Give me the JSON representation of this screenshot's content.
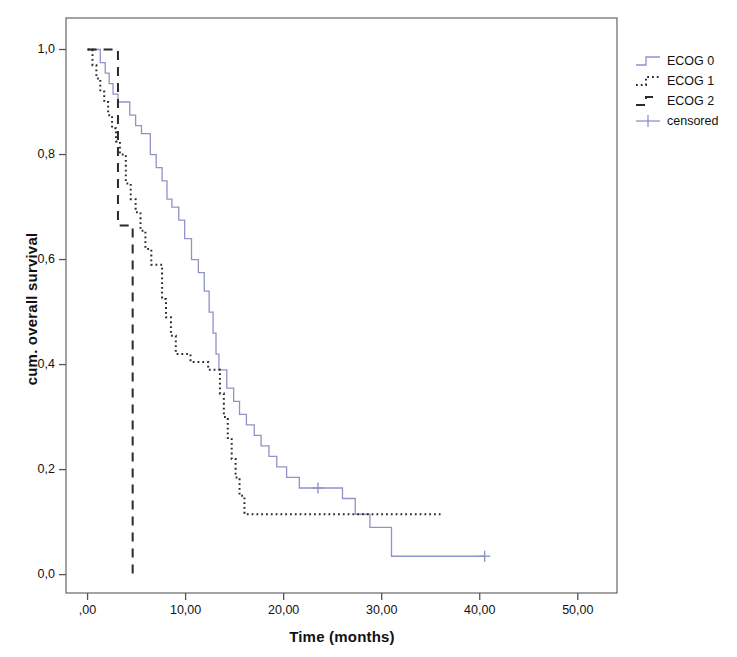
{
  "chart_data": {
    "type": "line",
    "plot_kind": "kaplan-meier-survival",
    "title": "",
    "xlabel": "Time (months)",
    "ylabel": "cum. overall survival",
    "xlim": [
      -2.2,
      54.0
    ],
    "ylim": [
      -0.035,
      1.06
    ],
    "xticks": [
      0,
      10,
      20,
      30,
      40,
      50
    ],
    "xtick_labels": [
      ",00",
      "10,00",
      "20,00",
      "30,00",
      "40,00",
      "50,00"
    ],
    "yticks": [
      0.0,
      0.2,
      0.4,
      0.6,
      0.8,
      1.0
    ],
    "ytick_labels": [
      "0,0",
      "0,2",
      "0,4",
      "0,6",
      "0,8",
      "1,0"
    ],
    "grid": false,
    "legend_position": "outside-right-top",
    "decimal_separator": "comma",
    "colors": {
      "ecog0": "#8f93c8",
      "ecog1": "#2b2b2b",
      "ecog2": "#2b2b2b",
      "censored": "#8f93c8",
      "axis": "#555555",
      "frame": "#666666"
    },
    "series": [
      {
        "name": "ECOG 0",
        "style": "solid",
        "color": "#8f93c8",
        "points": [
          [
            0.0,
            1.0
          ],
          [
            1.3,
            1.0
          ],
          [
            1.3,
            0.975
          ],
          [
            1.8,
            0.975
          ],
          [
            1.8,
            0.955
          ],
          [
            2.2,
            0.955
          ],
          [
            2.2,
            0.935
          ],
          [
            2.6,
            0.935
          ],
          [
            2.6,
            0.915
          ],
          [
            3.1,
            0.915
          ],
          [
            3.1,
            0.9
          ],
          [
            4.3,
            0.9
          ],
          [
            4.3,
            0.875
          ],
          [
            4.9,
            0.875
          ],
          [
            4.9,
            0.855
          ],
          [
            5.5,
            0.855
          ],
          [
            5.5,
            0.84
          ],
          [
            6.4,
            0.84
          ],
          [
            6.4,
            0.8
          ],
          [
            7.0,
            0.8
          ],
          [
            7.0,
            0.775
          ],
          [
            7.6,
            0.775
          ],
          [
            7.6,
            0.75
          ],
          [
            8.1,
            0.75
          ],
          [
            8.1,
            0.715
          ],
          [
            8.6,
            0.715
          ],
          [
            8.6,
            0.7
          ],
          [
            9.3,
            0.7
          ],
          [
            9.3,
            0.675
          ],
          [
            9.9,
            0.675
          ],
          [
            9.9,
            0.64
          ],
          [
            10.6,
            0.64
          ],
          [
            10.6,
            0.6
          ],
          [
            11.3,
            0.6
          ],
          [
            11.3,
            0.575
          ],
          [
            11.9,
            0.575
          ],
          [
            11.9,
            0.54
          ],
          [
            12.4,
            0.54
          ],
          [
            12.4,
            0.5
          ],
          [
            12.8,
            0.5
          ],
          [
            12.8,
            0.46
          ],
          [
            13.1,
            0.46
          ],
          [
            13.1,
            0.42
          ],
          [
            13.4,
            0.42
          ],
          [
            13.4,
            0.39
          ],
          [
            14.2,
            0.39
          ],
          [
            14.2,
            0.355
          ],
          [
            14.9,
            0.355
          ],
          [
            14.9,
            0.33
          ],
          [
            15.5,
            0.33
          ],
          [
            15.5,
            0.305
          ],
          [
            16.2,
            0.305
          ],
          [
            16.2,
            0.285
          ],
          [
            17.0,
            0.285
          ],
          [
            17.0,
            0.265
          ],
          [
            17.7,
            0.265
          ],
          [
            17.7,
            0.245
          ],
          [
            18.5,
            0.245
          ],
          [
            18.5,
            0.225
          ],
          [
            19.3,
            0.225
          ],
          [
            19.3,
            0.205
          ],
          [
            20.3,
            0.205
          ],
          [
            20.3,
            0.185
          ],
          [
            21.6,
            0.185
          ],
          [
            21.6,
            0.165
          ],
          [
            26.0,
            0.165
          ],
          [
            26.0,
            0.145
          ],
          [
            27.3,
            0.145
          ],
          [
            27.3,
            0.115
          ],
          [
            28.8,
            0.115
          ],
          [
            28.8,
            0.09
          ],
          [
            31.0,
            0.09
          ],
          [
            31.0,
            0.035
          ],
          [
            40.5,
            0.035
          ]
        ],
        "censored_points": [
          [
            23.5,
            0.165
          ],
          [
            40.5,
            0.035
          ]
        ]
      },
      {
        "name": "ECOG 1",
        "style": "dotted",
        "color": "#2b2b2b",
        "points": [
          [
            0.0,
            1.0
          ],
          [
            0.5,
            1.0
          ],
          [
            0.5,
            0.97
          ],
          [
            0.9,
            0.97
          ],
          [
            0.9,
            0.945
          ],
          [
            1.3,
            0.945
          ],
          [
            1.3,
            0.92
          ],
          [
            1.7,
            0.92
          ],
          [
            1.7,
            0.9
          ],
          [
            2.1,
            0.9
          ],
          [
            2.1,
            0.875
          ],
          [
            2.5,
            0.875
          ],
          [
            2.5,
            0.85
          ],
          [
            2.9,
            0.85
          ],
          [
            2.9,
            0.825
          ],
          [
            3.3,
            0.825
          ],
          [
            3.3,
            0.8
          ],
          [
            3.9,
            0.8
          ],
          [
            3.9,
            0.745
          ],
          [
            4.4,
            0.745
          ],
          [
            4.4,
            0.715
          ],
          [
            4.9,
            0.715
          ],
          [
            4.9,
            0.69
          ],
          [
            5.4,
            0.69
          ],
          [
            5.4,
            0.655
          ],
          [
            5.9,
            0.655
          ],
          [
            5.9,
            0.62
          ],
          [
            6.5,
            0.62
          ],
          [
            6.5,
            0.59
          ],
          [
            7.6,
            0.59
          ],
          [
            7.6,
            0.525
          ],
          [
            8.0,
            0.525
          ],
          [
            8.0,
            0.49
          ],
          [
            8.5,
            0.49
          ],
          [
            8.5,
            0.455
          ],
          [
            9.0,
            0.455
          ],
          [
            9.0,
            0.42
          ],
          [
            10.5,
            0.42
          ],
          [
            10.5,
            0.405
          ],
          [
            12.3,
            0.405
          ],
          [
            12.3,
            0.39
          ],
          [
            13.5,
            0.39
          ],
          [
            13.5,
            0.345
          ],
          [
            13.9,
            0.345
          ],
          [
            13.9,
            0.3
          ],
          [
            14.3,
            0.3
          ],
          [
            14.3,
            0.26
          ],
          [
            14.7,
            0.26
          ],
          [
            14.7,
            0.22
          ],
          [
            15.1,
            0.22
          ],
          [
            15.1,
            0.185
          ],
          [
            15.5,
            0.185
          ],
          [
            15.5,
            0.15
          ],
          [
            16.0,
            0.15
          ],
          [
            16.0,
            0.115
          ],
          [
            36.0,
            0.115
          ]
        ],
        "censored_points": []
      },
      {
        "name": "ECOG 2",
        "style": "dashed",
        "color": "#2b2b2b",
        "points": [
          [
            0.0,
            1.0
          ],
          [
            3.1,
            1.0
          ],
          [
            3.1,
            0.665
          ],
          [
            4.6,
            0.665
          ],
          [
            4.6,
            0.0
          ]
        ],
        "censored_points": []
      }
    ],
    "legend_entries": [
      {
        "label": "ECOG 0",
        "key": "step-solid",
        "color": "#8f93c8"
      },
      {
        "label": "ECOG 1",
        "key": "step-dotted",
        "color": "#2b2b2b"
      },
      {
        "label": "ECOG 2",
        "key": "step-dashed",
        "color": "#2b2b2b"
      },
      {
        "label": "censored",
        "key": "plus-marker",
        "color": "#8f93c8"
      }
    ]
  }
}
